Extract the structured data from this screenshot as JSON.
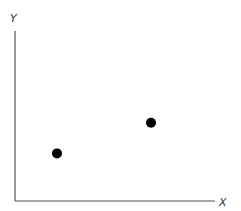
{
  "chart_data": {
    "type": "scatter",
    "title": "",
    "xlabel": "X",
    "ylabel": "Y",
    "x_ticks": [],
    "y_ticks": [],
    "grid": false,
    "legend": null,
    "series": [
      {
        "name": "points",
        "color": "#000000",
        "points": [
          {
            "x": 0.21,
            "y": 0.28
          },
          {
            "x": 0.68,
            "y": 0.46
          }
        ]
      }
    ],
    "xlim": [
      0,
      1
    ],
    "ylim": [
      0,
      1
    ]
  },
  "colors": {
    "axis": "#555555",
    "point": "#000000"
  }
}
